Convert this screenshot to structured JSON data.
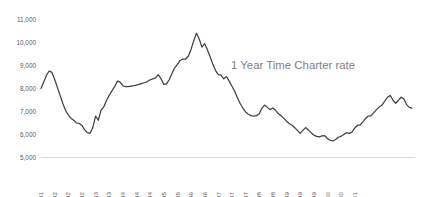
{
  "chart_data": {
    "type": "line",
    "title": "1 Year Time Charter rate",
    "xlabel": "",
    "ylabel": "",
    "ylim": [
      5000,
      11000
    ],
    "ytick_values": [
      5000,
      6000,
      7000,
      8000,
      9000,
      10000,
      11000
    ],
    "ytick_labels": [
      "5,000",
      "6,000",
      "7,000",
      "8,000",
      "9,000",
      "10,000",
      "11,000"
    ],
    "grid": false,
    "legend": "none",
    "line_color": "#404040",
    "axis_color": "#d9d9d9",
    "tick_label_color": "#595959",
    "title_color": "#7f7f7f",
    "xtick_labels": [
      "8-1991",
      "1-1992",
      "6-1992",
      "11-1992",
      "4-1993",
      "9-1993",
      "2-1994",
      "7-1994",
      "12-1994",
      "5-1995",
      "10-1995",
      "3-1996",
      "8-1996",
      "1-1997",
      "6-1997",
      "11-1997",
      "4-1998",
      "9-1998",
      "2-1999",
      "7-1999",
      "12-1999",
      "5-2000",
      "10-2000",
      "3-2001"
    ],
    "xtick_step_months": 5,
    "x_start": "8-1991",
    "x_end": "5-2001",
    "series": [
      {
        "name": "1 Year Time Charter rate",
        "values": [
          8000,
          8280,
          8580,
          8760,
          8700,
          8400,
          8050,
          7700,
          7350,
          7050,
          6850,
          6700,
          6620,
          6500,
          6480,
          6400,
          6200,
          6080,
          6050,
          6300,
          6800,
          6620,
          7050,
          7200,
          7480,
          7700,
          7900,
          8080,
          8320,
          8280,
          8120,
          8080,
          8080,
          8100,
          8120,
          8150,
          8180,
          8220,
          8250,
          8300,
          8380,
          8420,
          8460,
          8600,
          8420,
          8180,
          8200,
          8380,
          8650,
          8900,
          9050,
          9220,
          9280,
          9280,
          9400,
          9700,
          10080,
          10400,
          10150,
          9800,
          9950,
          9680,
          9380,
          9050,
          8780,
          8600,
          8580,
          8420,
          8520,
          8320,
          8100,
          7880,
          7600,
          7350,
          7150,
          6980,
          6880,
          6820,
          6800,
          6820,
          6900,
          7150,
          7280,
          7180,
          7080,
          7150,
          7050,
          6900,
          6820,
          6700,
          6580,
          6480,
          6400,
          6300,
          6180,
          6050,
          6180,
          6300,
          6200,
          6080,
          5980,
          5920,
          5900,
          5940,
          5950,
          5820,
          5750,
          5720,
          5780,
          5880,
          5920,
          6000,
          6080,
          6050,
          6100,
          6280,
          6400,
          6420,
          6550,
          6700,
          6800,
          6820,
          6950,
          7080,
          7200,
          7280,
          7450,
          7620,
          7700,
          7500,
          7350,
          7480,
          7620,
          7550,
          7300,
          7180,
          7150
        ]
      }
    ]
  }
}
